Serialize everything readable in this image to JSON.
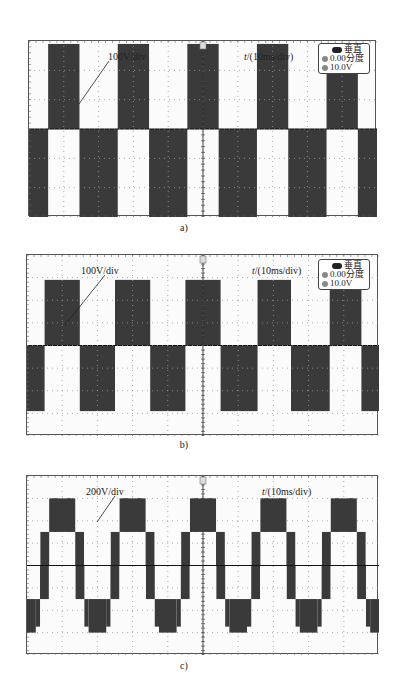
{
  "figure": {
    "panels": [
      {
        "id": "a",
        "caption": "a)",
        "volt_label": "100V/div",
        "time_label_var": "t",
        "time_label_rest": "/(10ms/div)",
        "legend": {
          "title": "垂直",
          "offset": "0.00分度",
          "scale": "10.0V"
        },
        "trigger_marker": "T"
      },
      {
        "id": "b",
        "caption": "b)",
        "volt_label": "100V/div",
        "time_label_var": "t",
        "time_label_rest": "/(10ms/div)",
        "legend": {
          "title": "垂直",
          "offset": "0.00分度",
          "scale": "10.0V"
        },
        "trigger_marker": "T"
      },
      {
        "id": "c",
        "caption": "c)",
        "volt_label": "200V/div",
        "time_label_var": "t",
        "time_label_rest": "/(10ms/div)",
        "trigger_marker": "T"
      }
    ],
    "colors": {
      "trace": "#3a3a3a",
      "grid": "#9a9a9a",
      "frame": "#555555",
      "background": "#fbfbfb"
    }
  },
  "chart_data": [
    {
      "type": "line",
      "title": "a)",
      "xlabel": "t/(10ms/div)",
      "ylabel": "100V/div",
      "grid": true,
      "divisions": {
        "x": 10,
        "y": 6
      },
      "description": "Two-level square-wave output voltage, ~50 Hz (period 2 div = 20 ms)",
      "series": [
        {
          "name": "output voltage",
          "time_div": [
            0,
            0.55,
            0.55,
            1.45,
            1.45,
            2.55,
            2.55,
            3.45,
            3.45,
            4.55,
            4.55,
            5.45,
            5.45,
            6.55,
            6.55,
            7.45,
            7.45,
            8.55,
            8.55,
            9.45,
            9.45,
            10
          ],
          "level_div": [
            -3,
            -3,
            2.9,
            2.9,
            -3,
            -3,
            2.9,
            2.9,
            -3,
            -3,
            2.9,
            2.9,
            -3,
            -3,
            2.9,
            2.9,
            -3,
            -3,
            2.9,
            2.9,
            -3,
            -3
          ]
        }
      ],
      "xlim": [
        0,
        10
      ],
      "ylim": [
        -3,
        3
      ]
    },
    {
      "type": "line",
      "title": "b)",
      "xlabel": "t/(10ms/div)",
      "ylabel": "100V/div",
      "grid": true,
      "divisions": {
        "x": 10,
        "y": 8
      },
      "description": "Two-level square-wave output voltage, ~50 Hz",
      "series": [
        {
          "name": "output voltage",
          "time_div": [
            0,
            0.5,
            0.5,
            1.5,
            1.5,
            2.5,
            2.5,
            3.5,
            3.5,
            4.5,
            4.5,
            5.5,
            5.5,
            6.55,
            6.55,
            7.5,
            7.5,
            8.6,
            8.6,
            9.5,
            9.5,
            10
          ],
          "level_div": [
            -2.9,
            -2.9,
            2.9,
            2.9,
            -2.9,
            -2.9,
            2.9,
            2.9,
            -2.9,
            -2.9,
            2.9,
            2.9,
            -2.9,
            -2.9,
            2.9,
            2.9,
            -2.9,
            -2.9,
            2.9,
            2.9,
            -2.9,
            -2.9
          ]
        }
      ],
      "xlim": [
        0,
        10
      ],
      "ylim": [
        -4,
        4
      ]
    },
    {
      "type": "line",
      "title": "c)",
      "xlabel": "t/(10ms/div)",
      "ylabel": "200V/div",
      "grid": true,
      "divisions": {
        "x": 10,
        "y": 8
      },
      "description": "Five-level staircase output voltage (levels 0, ±1.5, ±3 div), ~50 Hz",
      "series": [
        {
          "name": "output voltage",
          "levels_div": [
            -3,
            -1.5,
            0,
            1.5,
            3
          ],
          "period_div": 2,
          "first_positive_peak_center_div": 1.0
        }
      ],
      "xlim": [
        0,
        10
      ],
      "ylim": [
        -4,
        4
      ]
    }
  ]
}
